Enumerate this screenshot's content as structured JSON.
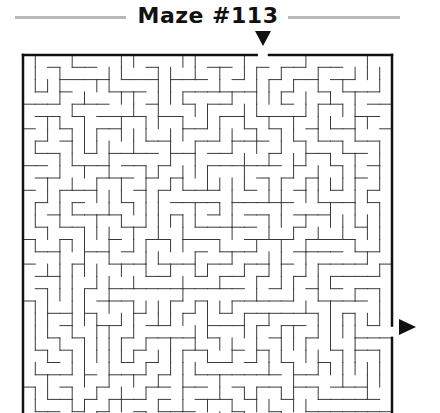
{
  "title": "Maze #113",
  "colors": {
    "wall": "#3a3a3a",
    "border": "#111111",
    "rule": "#b8b8b8"
  },
  "maze": {
    "left": 23,
    "top": 55,
    "cell": 12.3,
    "cols": 30,
    "rows": 30,
    "seed": 113,
    "entry": {
      "side": "top",
      "col": 19
    },
    "exit": {
      "side": "right",
      "row": 22
    }
  },
  "markers": {
    "entry": "down-triangle",
    "exit": "right-triangle"
  }
}
